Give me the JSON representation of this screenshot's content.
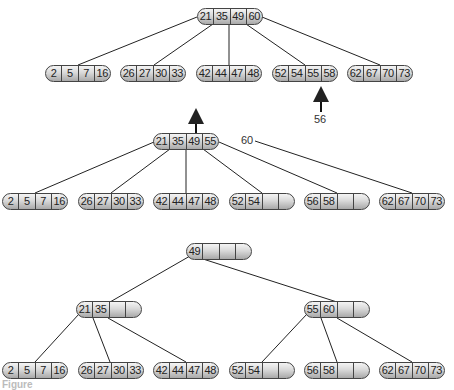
{
  "diagram": {
    "type": "b-tree-insertion",
    "stage1": {
      "root": {
        "keys": [
          "21",
          "35",
          "49",
          "60"
        ]
      },
      "leaves": [
        {
          "keys": [
            "2",
            "5",
            "7",
            "16"
          ]
        },
        {
          "keys": [
            "26",
            "27",
            "30",
            "33"
          ]
        },
        {
          "keys": [
            "42",
            "44",
            "47",
            "48"
          ]
        },
        {
          "keys": [
            "52",
            "54",
            "55",
            "58"
          ]
        },
        {
          "keys": [
            "62",
            "67",
            "70",
            "73"
          ]
        }
      ],
      "insert_label": "56"
    },
    "stage2": {
      "root": {
        "keys": [
          "21",
          "35",
          "49",
          "55"
        ]
      },
      "overflow_label": "60",
      "leaves": [
        {
          "keys": [
            "2",
            "5",
            "7",
            "16"
          ]
        },
        {
          "keys": [
            "26",
            "27",
            "30",
            "33"
          ]
        },
        {
          "keys": [
            "42",
            "44",
            "47",
            "48"
          ]
        },
        {
          "keys": [
            "52",
            "54",
            "",
            ""
          ]
        },
        {
          "keys": [
            "56",
            "58",
            "",
            ""
          ]
        },
        {
          "keys": [
            "62",
            "67",
            "70",
            "73"
          ]
        }
      ]
    },
    "stage3": {
      "root": {
        "keys": [
          "49",
          "",
          "",
          ""
        ]
      },
      "internal": [
        {
          "keys": [
            "21",
            "35",
            "",
            ""
          ]
        },
        {
          "keys": [
            "55",
            "60",
            "",
            ""
          ]
        }
      ],
      "leaves": [
        {
          "keys": [
            "2",
            "5",
            "7",
            "16"
          ]
        },
        {
          "keys": [
            "26",
            "27",
            "30",
            "33"
          ]
        },
        {
          "keys": [
            "42",
            "44",
            "47",
            "48"
          ]
        },
        {
          "keys": [
            "52",
            "54",
            "",
            ""
          ]
        },
        {
          "keys": [
            "56",
            "58",
            "",
            ""
          ]
        },
        {
          "keys": [
            "62",
            "67",
            "70",
            "73"
          ]
        }
      ]
    },
    "caption": "Figure"
  }
}
